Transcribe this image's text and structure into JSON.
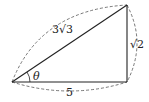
{
  "diagram": {
    "type": "right-triangle",
    "vertices": {
      "A": {
        "x": 12,
        "y": 82
      },
      "B": {
        "x": 127,
        "y": 82
      },
      "C": {
        "x": 127,
        "y": 5
      }
    },
    "labels": {
      "hypotenuse": "3√3",
      "vertical_side": "√2",
      "bottom_side": "5",
      "angle": "θ"
    },
    "colors": {
      "line": "#222222",
      "dashed": "#555555",
      "background": "#ffffff"
    }
  }
}
